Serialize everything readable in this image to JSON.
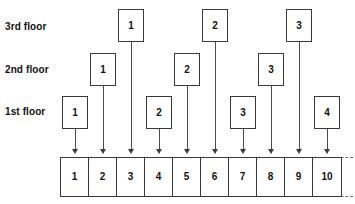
{
  "diagram": {
    "floor_labels": [
      {
        "key": "floor3",
        "label": "3rd floor"
      },
      {
        "key": "floor2",
        "label": "2nd floor"
      },
      {
        "key": "floor1",
        "label": "1st floor"
      }
    ],
    "room_boxes": [
      {
        "id": "f1-r1",
        "floor": "1st floor",
        "label": "1",
        "x": 62,
        "y": 96,
        "target_cell": "1"
      },
      {
        "id": "f2-r1",
        "floor": "2nd floor",
        "label": "1",
        "x": 90,
        "y": 53,
        "target_cell": "2"
      },
      {
        "id": "f3-r1",
        "floor": "3rd floor",
        "label": "1",
        "x": 118,
        "y": 9,
        "target_cell": "3"
      },
      {
        "id": "f1-r2",
        "floor": "1st floor",
        "label": "2",
        "x": 146,
        "y": 96,
        "target_cell": "4"
      },
      {
        "id": "f2-r2",
        "floor": "2nd floor",
        "label": "2",
        "x": 174,
        "y": 53,
        "target_cell": "5"
      },
      {
        "id": "f3-r2",
        "floor": "3rd floor",
        "label": "2",
        "x": 202,
        "y": 9,
        "target_cell": "6"
      },
      {
        "id": "f1-r3",
        "floor": "1st floor",
        "label": "3",
        "x": 230,
        "y": 96,
        "target_cell": "7"
      },
      {
        "id": "f2-r3",
        "floor": "2nd floor",
        "label": "3",
        "x": 258,
        "y": 53,
        "target_cell": "8"
      },
      {
        "id": "f3-r3",
        "floor": "3rd floor",
        "label": "3",
        "x": 286,
        "y": 9,
        "target_cell": "9"
      },
      {
        "id": "f1-r4",
        "floor": "1st floor",
        "label": "4",
        "x": 314,
        "y": 96,
        "target_cell": "10"
      }
    ],
    "strip": {
      "cells": [
        "1",
        "2",
        "3",
        "4",
        "5",
        "6",
        "7",
        "8",
        "9",
        "10"
      ],
      "continues": true
    },
    "colors": {
      "line": "#3a3a3a",
      "text": "#111111",
      "background": "#ffffff"
    }
  }
}
